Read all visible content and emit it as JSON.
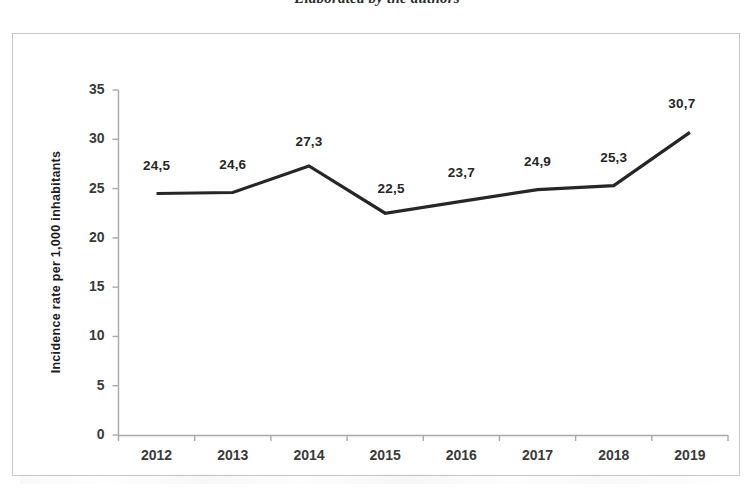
{
  "figure": {
    "caption": "Elaborated by the authors"
  },
  "chart_data": {
    "type": "line",
    "title": "",
    "xlabel": "",
    "ylabel": "Incidence rate per 1,000 inhabitants",
    "categories": [
      "2012",
      "2013",
      "2014",
      "2015",
      "2016",
      "2017",
      "2018",
      "2019"
    ],
    "values": [
      24.5,
      24.6,
      27.3,
      22.5,
      23.7,
      24.9,
      25.3,
      30.7
    ],
    "data_labels": [
      "24,5",
      "24,6",
      "27,3",
      "22,5",
      "23,7",
      "24,9",
      "25,3",
      "30,7"
    ],
    "ylim": [
      0,
      35
    ],
    "ytick_labels": [
      "0",
      "5",
      "10",
      "15",
      "20",
      "25",
      "30",
      "35"
    ],
    "ytick_values": [
      0,
      5,
      10,
      15,
      20,
      25,
      30,
      35
    ],
    "grid": false,
    "legend": "none",
    "series_color": "#262626",
    "axis_color": "#a8a8a8"
  }
}
